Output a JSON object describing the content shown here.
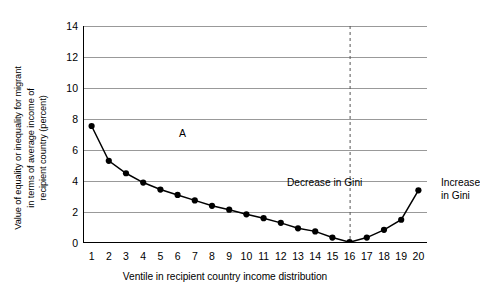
{
  "chart_data": {
    "type": "line",
    "title": "",
    "xlabel": "Ventile in recipient country income distribution",
    "ylabel": "Value of equality or inequality for migrant\nin terms of average income of\nrecipient country (percent)",
    "categories": [
      "1",
      "2",
      "3",
      "4",
      "5",
      "6",
      "7",
      "8",
      "9",
      "10",
      "11",
      "12",
      "13",
      "14",
      "15",
      "16",
      "17",
      "18",
      "19",
      "20"
    ],
    "x": [
      1,
      2,
      3,
      4,
      5,
      6,
      7,
      8,
      9,
      10,
      11,
      12,
      13,
      14,
      15,
      16,
      17,
      18,
      19,
      20
    ],
    "values": [
      7.55,
      5.3,
      4.5,
      3.9,
      3.45,
      3.1,
      2.75,
      2.4,
      2.15,
      1.85,
      1.6,
      1.3,
      0.95,
      0.75,
      0.35,
      0.05,
      0.35,
      0.85,
      1.5,
      3.4
    ],
    "ylim": [
      0,
      14
    ],
    "yticks": [
      0,
      2,
      4,
      6,
      8,
      10,
      12,
      14
    ],
    "xlim": [
      0.5,
      20.5
    ],
    "grid": "horizontal",
    "legend": "none",
    "series_color": "#000000",
    "grid_color": "#999999",
    "marker": "filled-circle",
    "annotations": [
      {
        "name": "point-a-label",
        "text": "A",
        "x": 1,
        "y": 8.6
      },
      {
        "name": "decrease-region-label",
        "text": "Decrease in Gini",
        "x": 9.3,
        "y": 6.0
      },
      {
        "name": "increase-region-label",
        "text": "Increase\nin Gini",
        "x": 18.2,
        "y": 6.0
      }
    ],
    "reference_line": {
      "name": "gini-divider",
      "x": 16,
      "style": "dashed",
      "color": "#555555"
    }
  }
}
